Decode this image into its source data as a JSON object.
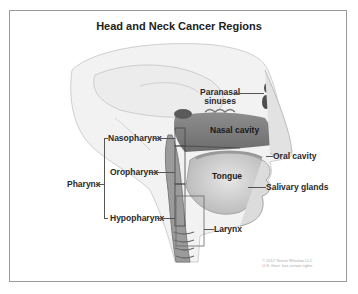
{
  "title": "Head and Neck Cancer Regions",
  "labels": {
    "paranasal_sinuses": [
      "Paranasal",
      "sinuses"
    ],
    "nasal_cavity": "Nasal cavity",
    "nasopharynx": "Nasopharynx",
    "oropharynx": "Oropharynx",
    "hypopharynx": "Hypopharynx",
    "pharynx": "Pharynx",
    "oral_cavity": "Oral cavity",
    "tongue": "Tongue",
    "salivary_glands": "Salivary glands",
    "larynx": "Larynx"
  },
  "copyright": [
    "© 2012 Terese Winslow LLC",
    "U.S. Govt. has certain rights"
  ]
}
